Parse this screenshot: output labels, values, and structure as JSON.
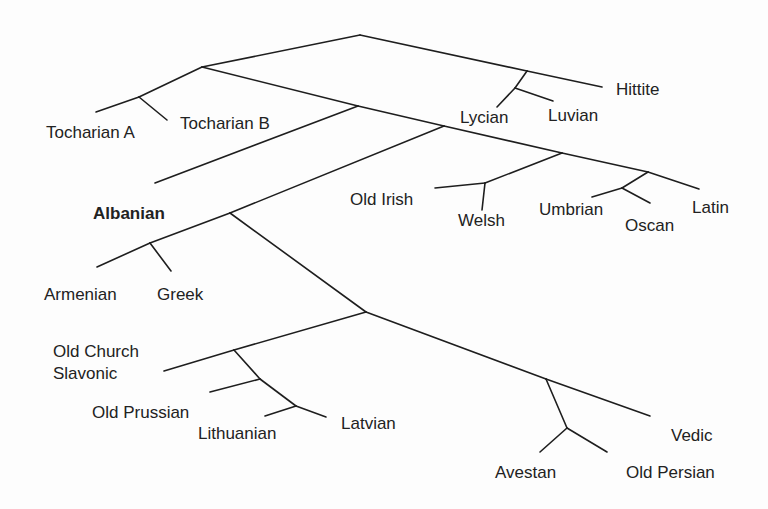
{
  "diagram": {
    "type": "phylogenetic-tree",
    "line_color": "#1e1e1e",
    "text_color": "#222222",
    "background": "#fdfdfd",
    "leaves": {
      "hittite": "Hittite",
      "lycian": "Lycian",
      "luvian": "Luvian",
      "tocharian_a": "Tocharian A",
      "tocharian_b": "Tocharian B",
      "albanian": "Albanian",
      "old_irish": "Old Irish",
      "welsh": "Welsh",
      "umbrian": "Umbrian",
      "oscan": "Oscan",
      "latin": "Latin",
      "armenian": "Armenian",
      "greek": "Greek",
      "old_church_slavonic": "Old Church\nSlavonic",
      "old_prussian": "Old Prussian",
      "lithuanian": "Lithuanian",
      "latvian": "Latvian",
      "vedic": "Vedic",
      "avestan": "Avestan",
      "old_persian": "Old Persian"
    },
    "highlighted_leaf": "Albanian",
    "edges": [
      {
        "from": [
          360,
          35
        ],
        "to": [
          527,
          71
        ]
      },
      {
        "from": [
          527,
          71
        ],
        "to": [
          602,
          87
        ]
      },
      {
        "from": [
          527,
          71
        ],
        "to": [
          515,
          88
        ]
      },
      {
        "from": [
          515,
          88
        ],
        "to": [
          497,
          107
        ]
      },
      {
        "from": [
          515,
          88
        ],
        "to": [
          553,
          101
        ]
      },
      {
        "from": [
          360,
          35
        ],
        "to": [
          202,
          67
        ]
      },
      {
        "from": [
          202,
          67
        ],
        "to": [
          139,
          97
        ]
      },
      {
        "from": [
          139,
          97
        ],
        "to": [
          96,
          112
        ]
      },
      {
        "from": [
          139,
          97
        ],
        "to": [
          167,
          120
        ]
      },
      {
        "from": [
          202,
          67
        ],
        "to": [
          358,
          106
        ]
      },
      {
        "from": [
          358,
          106
        ],
        "to": [
          155,
          183
        ]
      },
      {
        "from": [
          358,
          106
        ],
        "to": [
          444,
          126
        ]
      },
      {
        "from": [
          444,
          126
        ],
        "to": [
          562,
          153
        ]
      },
      {
        "from": [
          562,
          153
        ],
        "to": [
          485,
          183
        ]
      },
      {
        "from": [
          485,
          183
        ],
        "to": [
          435,
          188
        ]
      },
      {
        "from": [
          485,
          183
        ],
        "to": [
          482,
          210
        ]
      },
      {
        "from": [
          562,
          153
        ],
        "to": [
          648,
          172
        ]
      },
      {
        "from": [
          648,
          172
        ],
        "to": [
          699,
          189
        ]
      },
      {
        "from": [
          648,
          172
        ],
        "to": [
          622,
          188
        ]
      },
      {
        "from": [
          622,
          188
        ],
        "to": [
          592,
          197
        ]
      },
      {
        "from": [
          622,
          188
        ],
        "to": [
          650,
          203
        ]
      },
      {
        "from": [
          444,
          126
        ],
        "to": [
          230,
          213
        ]
      },
      {
        "from": [
          230,
          213
        ],
        "to": [
          150,
          243
        ]
      },
      {
        "from": [
          150,
          243
        ],
        "to": [
          97,
          267
        ]
      },
      {
        "from": [
          150,
          243
        ],
        "to": [
          171,
          271
        ]
      },
      {
        "from": [
          230,
          213
        ],
        "to": [
          366,
          312
        ]
      },
      {
        "from": [
          366,
          312
        ],
        "to": [
          546,
          379
        ]
      },
      {
        "from": [
          546,
          379
        ],
        "to": [
          650,
          416
        ]
      },
      {
        "from": [
          546,
          379
        ],
        "to": [
          567,
          428
        ]
      },
      {
        "from": [
          567,
          428
        ],
        "to": [
          540,
          452
        ]
      },
      {
        "from": [
          567,
          428
        ],
        "to": [
          607,
          452
        ]
      },
      {
        "from": [
          366,
          312
        ],
        "to": [
          234,
          350
        ]
      },
      {
        "from": [
          234,
          350
        ],
        "to": [
          164,
          371
        ]
      },
      {
        "from": [
          234,
          350
        ],
        "to": [
          260,
          379
        ]
      },
      {
        "from": [
          260,
          379
        ],
        "to": [
          210,
          392
        ]
      },
      {
        "from": [
          260,
          379
        ],
        "to": [
          296,
          406
        ]
      },
      {
        "from": [
          296,
          406
        ],
        "to": [
          265,
          416
        ]
      },
      {
        "from": [
          296,
          406
        ],
        "to": [
          326,
          417
        ]
      }
    ]
  }
}
